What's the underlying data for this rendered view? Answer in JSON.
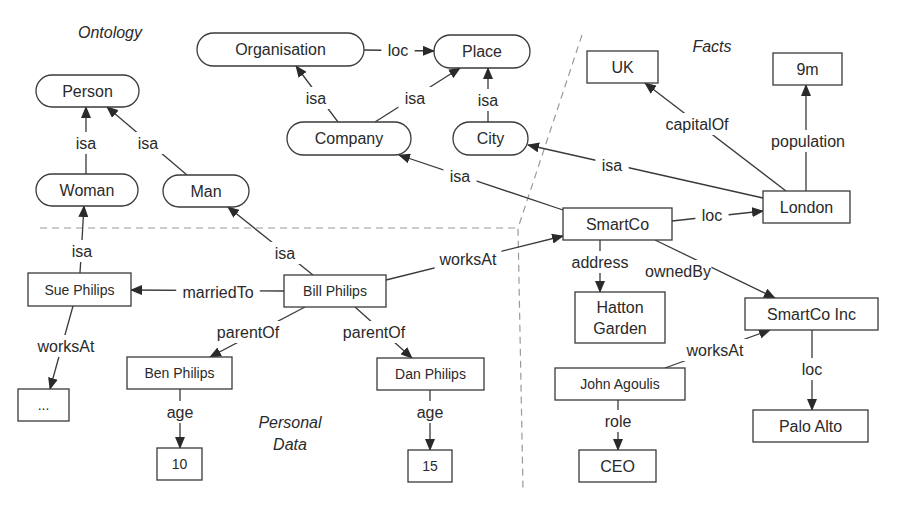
{
  "regions": [
    {
      "id": "ontology",
      "label": "Ontology",
      "x": 110,
      "y": 32
    },
    {
      "id": "facts",
      "label": "Facts",
      "x": 712,
      "y": 46
    },
    {
      "id": "personal-data-1",
      "label": "Personal",
      "x": 290,
      "y": 422
    },
    {
      "id": "personal-data-2",
      "label": "Data",
      "x": 290,
      "y": 444
    }
  ],
  "dividers": [
    {
      "id": "horizontal-divider",
      "points": [
        [
          40,
          228
        ],
        [
          518,
          228
        ]
      ]
    },
    {
      "id": "facts-divider",
      "points": [
        [
          582,
          35
        ],
        [
          518,
          228
        ],
        [
          523,
          490
        ]
      ]
    }
  ],
  "nodes": [
    {
      "id": "person",
      "label": "Person",
      "shape": "rounded",
      "x": 36,
      "y": 75,
      "w": 103,
      "h": 32
    },
    {
      "id": "woman",
      "label": "Woman",
      "shape": "rounded",
      "x": 36,
      "y": 174,
      "w": 102,
      "h": 32
    },
    {
      "id": "man",
      "label": "Man",
      "shape": "rounded",
      "x": 163,
      "y": 175,
      "w": 86,
      "h": 32
    },
    {
      "id": "organisation",
      "label": "Organisation",
      "shape": "rounded",
      "x": 197,
      "y": 33,
      "w": 167,
      "h": 33
    },
    {
      "id": "place",
      "label": "Place",
      "shape": "rounded",
      "x": 434,
      "y": 35,
      "w": 96,
      "h": 33
    },
    {
      "id": "company",
      "label": "Company",
      "shape": "rounded",
      "x": 287,
      "y": 122,
      "w": 124,
      "h": 33
    },
    {
      "id": "city",
      "label": "City",
      "shape": "rounded",
      "x": 453,
      "y": 122,
      "w": 75,
      "h": 33
    },
    {
      "id": "uk",
      "label": "UK",
      "shape": "rect",
      "x": 587,
      "y": 51,
      "w": 71,
      "h": 32
    },
    {
      "id": "nine-m",
      "label": "9m",
      "shape": "rect",
      "x": 773,
      "y": 53,
      "w": 69,
      "h": 32
    },
    {
      "id": "london",
      "label": "London",
      "shape": "rect",
      "x": 763,
      "y": 191,
      "w": 87,
      "h": 32
    },
    {
      "id": "smartco",
      "label": "SmartCo",
      "shape": "rect",
      "x": 563,
      "y": 208,
      "w": 109,
      "h": 32
    },
    {
      "id": "hatton-garden",
      "label": "Hatton",
      "label2": "Garden",
      "shape": "rect",
      "x": 575,
      "y": 292,
      "w": 90,
      "h": 51
    },
    {
      "id": "smartco-inc",
      "label": "SmartCo Inc",
      "shape": "rect",
      "x": 745,
      "y": 298,
      "w": 133,
      "h": 32
    },
    {
      "id": "john-agoulis",
      "label": "John Agoulis",
      "shape": "rect",
      "x": 555,
      "y": 368,
      "w": 130,
      "h": 32,
      "small": true
    },
    {
      "id": "palo-alto",
      "label": "Palo Alto",
      "shape": "rect",
      "x": 753,
      "y": 410,
      "w": 115,
      "h": 32
    },
    {
      "id": "ceo",
      "label": "CEO",
      "shape": "rect",
      "x": 579,
      "y": 450,
      "w": 77,
      "h": 32
    },
    {
      "id": "sue-philips",
      "label": "Sue Philips",
      "shape": "rect",
      "x": 28,
      "y": 273,
      "w": 103,
      "h": 33,
      "small": true
    },
    {
      "id": "bill-philips",
      "label": "Bill Philips",
      "shape": "rect",
      "x": 284,
      "y": 275,
      "w": 102,
      "h": 32,
      "small": true
    },
    {
      "id": "ellipsis",
      "label": "...",
      "shape": "rect",
      "x": 18,
      "y": 389,
      "w": 51,
      "h": 32,
      "small": true
    },
    {
      "id": "ben-philips",
      "label": "Ben Philips",
      "shape": "rect",
      "x": 127,
      "y": 357,
      "w": 105,
      "h": 32,
      "small": true
    },
    {
      "id": "dan-philips",
      "label": "Dan Philips",
      "shape": "rect",
      "x": 377,
      "y": 358,
      "w": 107,
      "h": 32,
      "small": true
    },
    {
      "id": "age-10",
      "label": "10",
      "shape": "rect",
      "x": 157,
      "y": 448,
      "w": 45,
      "h": 32,
      "small": true
    },
    {
      "id": "age-15",
      "label": "15",
      "shape": "rect",
      "x": 408,
      "y": 450,
      "w": 44,
      "h": 32,
      "small": true
    }
  ],
  "edges": [
    {
      "id": "woman-isa-person",
      "label": "isa",
      "from": [
        86,
        174
      ],
      "to": [
        86,
        107
      ],
      "lx": 86,
      "ly": 143
    },
    {
      "id": "man-isa-person",
      "label": "isa",
      "from": [
        187,
        175
      ],
      "to": [
        107,
        107
      ],
      "lx": 148,
      "ly": 143
    },
    {
      "id": "company-isa-organisation",
      "label": "isa",
      "from": [
        338,
        122
      ],
      "to": [
        296,
        66
      ],
      "lx": 316,
      "ly": 98
    },
    {
      "id": "company-isa-place",
      "label": "isa",
      "from": [
        375,
        122
      ],
      "to": [
        460,
        68
      ],
      "lx": 415,
      "ly": 98
    },
    {
      "id": "city-isa-place",
      "label": "isa",
      "from": [
        488,
        122
      ],
      "to": [
        488,
        68
      ],
      "lx": 488,
      "ly": 100
    },
    {
      "id": "organisation-loc-place",
      "label": "loc",
      "from": [
        364,
        50
      ],
      "to": [
        434,
        51
      ],
      "lx": 398,
      "ly": 50
    },
    {
      "id": "smartco-isa-company",
      "label": "isa",
      "from": [
        563,
        210
      ],
      "to": [
        399,
        155
      ],
      "lx": 460,
      "ly": 176
    },
    {
      "id": "london-isa-city",
      "label": "isa",
      "from": [
        763,
        198
      ],
      "to": [
        528,
        145
      ],
      "lx": 612,
      "ly": 165
    },
    {
      "id": "london-capitalof-uk",
      "label": "capitalOf",
      "from": [
        786,
        191
      ],
      "to": [
        645,
        83
      ],
      "lx": 697,
      "ly": 124
    },
    {
      "id": "london-population-9m",
      "label": "population",
      "from": [
        806,
        191
      ],
      "to": [
        806,
        85
      ],
      "lx": 808,
      "ly": 141
    },
    {
      "id": "smartco-loc-london",
      "label": "loc",
      "from": [
        672,
        221
      ],
      "to": [
        763,
        211
      ],
      "lx": 712,
      "ly": 215
    },
    {
      "id": "smartco-address-hatton",
      "label": "address",
      "from": [
        600,
        240
      ],
      "to": [
        600,
        292
      ],
      "lx": 600,
      "ly": 262
    },
    {
      "id": "smartco-ownedby-inc",
      "label": "ownedBy",
      "from": [
        655,
        240
      ],
      "to": [
        775,
        298
      ],
      "lx": 678,
      "ly": 271
    },
    {
      "id": "john-worksat-inc",
      "label": "worksAt",
      "from": [
        665,
        368
      ],
      "to": [
        770,
        330
      ],
      "lx": 715,
      "ly": 350
    },
    {
      "id": "inc-loc-paloalto",
      "label": "loc",
      "from": [
        812,
        330
      ],
      "to": [
        812,
        410
      ],
      "lx": 812,
      "ly": 369
    },
    {
      "id": "john-role-ceo",
      "label": "role",
      "from": [
        618,
        400
      ],
      "to": [
        618,
        450
      ],
      "lx": 618,
      "ly": 421
    },
    {
      "id": "sue-isa-woman",
      "label": "isa",
      "from": [
        80,
        273
      ],
      "to": [
        84,
        206
      ],
      "lx": 82,
      "ly": 251
    },
    {
      "id": "bill-isa-man",
      "label": "isa",
      "from": [
        313,
        275
      ],
      "to": [
        228,
        207
      ],
      "lx": 285,
      "ly": 253
    },
    {
      "id": "bill-marriedto-sue",
      "label": "marriedTo",
      "from": [
        284,
        291
      ],
      "to": [
        131,
        290
      ],
      "lx": 218,
      "ly": 292
    },
    {
      "id": "bill-worksat-smartco",
      "label": "worksAt",
      "from": [
        386,
        280
      ],
      "to": [
        563,
        236
      ],
      "lx": 468,
      "ly": 259
    },
    {
      "id": "sue-worksat-ellipsis",
      "label": "worksAt",
      "from": [
        73,
        306
      ],
      "to": [
        50,
        389
      ],
      "lx": 66,
      "ly": 346
    },
    {
      "id": "bill-parentof-ben",
      "label": "parentOf",
      "from": [
        305,
        307
      ],
      "to": [
        210,
        357
      ],
      "lx": 248,
      "ly": 332
    },
    {
      "id": "bill-parentof-dan",
      "label": "parentOf",
      "from": [
        355,
        307
      ],
      "to": [
        412,
        358
      ],
      "lx": 374,
      "ly": 332
    },
    {
      "id": "ben-age-10",
      "label": "age",
      "from": [
        180,
        389
      ],
      "to": [
        180,
        448
      ],
      "lx": 180,
      "ly": 412
    },
    {
      "id": "dan-age-15",
      "label": "age",
      "from": [
        430,
        390
      ],
      "to": [
        430,
        450
      ],
      "lx": 430,
      "ly": 412
    }
  ]
}
